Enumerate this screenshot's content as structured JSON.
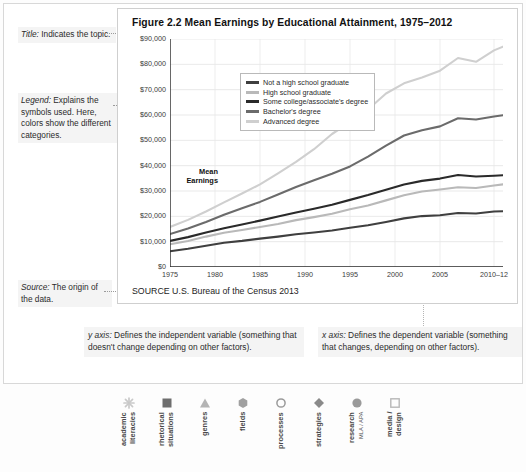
{
  "figure": {
    "title": "Figure 2.2  Mean Earnings by Educational Attainment, 1975–2012",
    "source_label": "SOURCE",
    "source_text": "U.S. Bureau of the Census 2013"
  },
  "margin_notes": {
    "title_note_label": "Title:",
    "title_note_text": " Indicates the topic.",
    "legend_note_label": "Legend:",
    "legend_note_text": " Explains the symbols used. Here, colors show the different categories.",
    "source_note_label": "Source:",
    "source_note_text": " The origin of the data."
  },
  "axis_notes": {
    "y_label": "y axis:",
    "y_text": " Defines the independent variable (something that doesn't change depending on other factors).",
    "x_label": "x axis:",
    "x_text": " Defines the dependent variable (something that changes, depending on other factors)."
  },
  "icon_strip": [
    {
      "name": "academic-literacies",
      "glyph": "asterisk",
      "line1": "academic",
      "line2": "literacies",
      "color": "#c9c9c9"
    },
    {
      "name": "rhetorical-situations",
      "glyph": "square-filled",
      "line1": "rhetorical",
      "line2": "situations",
      "color": "#6e6e6e"
    },
    {
      "name": "genres",
      "glyph": "triangle",
      "line1": "genres",
      "line2": "",
      "color": "#b4b4b4"
    },
    {
      "name": "fields",
      "glyph": "hexagon",
      "line1": "fields",
      "line2": "",
      "color": "#a0a0a0"
    },
    {
      "name": "processes",
      "glyph": "circle-outline",
      "line1": "processes",
      "line2": "",
      "color": "#9a9a9a"
    },
    {
      "name": "strategies",
      "glyph": "diamond",
      "line1": "strategies",
      "line2": "",
      "color": "#8a8a8a"
    },
    {
      "name": "research",
      "glyph": "circle-filled",
      "line1": "research",
      "line2": "MLA / APA",
      "color": "#9a9a9a"
    },
    {
      "name": "media-design",
      "glyph": "square-outline",
      "line1": "media /",
      "line2": "design",
      "color": "#b8b8b8"
    }
  ],
  "chart_data": {
    "type": "line",
    "title": "Figure 2.2  Mean Earnings by Educational Attainment, 1975–2012",
    "xlabel": "",
    "ylabel": "Mean Earnings",
    "ylim": [
      0,
      90000
    ],
    "ytick_labels": [
      "$0",
      "$10,000",
      "$20,000",
      "$30,000",
      "$40,000",
      "$50,000",
      "$60,000",
      "$70,000",
      "$80,000",
      "$90,000"
    ],
    "ytick_values": [
      0,
      10000,
      20000,
      30000,
      40000,
      50000,
      60000,
      70000,
      80000,
      90000
    ],
    "xtick_labels": [
      "1975",
      "1980",
      "1985",
      "1990",
      "1995",
      "2000",
      "2005",
      "2010–12"
    ],
    "xtick_values": [
      1975,
      1980,
      1985,
      1990,
      1995,
      2000,
      2005,
      2011
    ],
    "xlim": [
      1975,
      2012
    ],
    "grid": true,
    "legend_position": "upper-left",
    "x": [
      1975,
      1977,
      1979,
      1981,
      1983,
      1985,
      1987,
      1989,
      1991,
      1993,
      1995,
      1997,
      1999,
      2001,
      2003,
      2005,
      2007,
      2009,
      2011,
      2012
    ],
    "series": [
      {
        "name": "Not a high school graduate",
        "color": "#3f3f3f",
        "values": [
          6200,
          7200,
          8400,
          9600,
          10300,
          11200,
          12000,
          12900,
          13600,
          14400,
          15500,
          16500,
          17800,
          19200,
          20100,
          20400,
          21300,
          21100,
          21900,
          22000
        ]
      },
      {
        "name": "High school graduate",
        "color": "#b9b9b9",
        "values": [
          9000,
          10300,
          12000,
          13500,
          14600,
          15800,
          17000,
          18500,
          19700,
          21000,
          22800,
          24300,
          26300,
          28300,
          29800,
          30600,
          31500,
          31200,
          32200,
          32600
        ]
      },
      {
        "name": "Some college/associate's degree",
        "color": "#2a2a2a",
        "values": [
          10300,
          11800,
          13600,
          15300,
          16800,
          18300,
          19900,
          21500,
          23000,
          24600,
          26500,
          28400,
          30500,
          32600,
          34000,
          34900,
          36300,
          35700,
          36000,
          36200
        ]
      },
      {
        "name": "Bachelor's degree",
        "color": "#6b6b6b",
        "values": [
          13000,
          15200,
          17800,
          20600,
          23200,
          25700,
          28600,
          31600,
          34200,
          36800,
          39700,
          43600,
          47900,
          51900,
          54000,
          55500,
          58700,
          58200,
          59400,
          59900
        ]
      },
      {
        "name": "Advanced degree",
        "color": "#cfcfcf",
        "values": [
          15800,
          18600,
          21900,
          25500,
          29000,
          32600,
          37000,
          41500,
          46500,
          52500,
          57200,
          62200,
          68500,
          72500,
          74800,
          77500,
          82500,
          81000,
          85500,
          87000
        ]
      }
    ]
  }
}
